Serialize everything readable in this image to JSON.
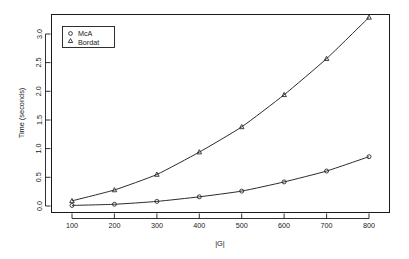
{
  "chart_data": {
    "type": "line",
    "title": "",
    "subtitle": "",
    "xlabel": "|G|",
    "ylabel": "Time (seconds)",
    "x": [
      100,
      200,
      300,
      400,
      500,
      600,
      700,
      800
    ],
    "xlim": [
      60,
      840
    ],
    "ylim": [
      -0.09,
      3.45
    ],
    "xticks": [
      100,
      200,
      300,
      400,
      500,
      600,
      700,
      800
    ],
    "xticklabels": [
      "100",
      "200",
      "300",
      "400",
      "500",
      "600",
      "700",
      "800"
    ],
    "yticks": [
      0.0,
      0.5,
      1.0,
      1.5,
      2.0,
      2.5,
      3.0
    ],
    "yticklabels": [
      "0.0",
      "0.5",
      "1.0",
      "1.5",
      "2.0",
      "2.5",
      "3.0"
    ],
    "grid": false,
    "legend_position": "upper left",
    "series": [
      {
        "name": "McA",
        "marker": "circle",
        "color": "#2b2b2b",
        "values": [
          0.01,
          0.03,
          0.08,
          0.16,
          0.26,
          0.42,
          0.61,
          0.86
        ]
      },
      {
        "name": "Bordat",
        "marker": "triangle",
        "color": "#2b2b2b",
        "values": [
          0.09,
          0.28,
          0.55,
          0.94,
          1.38,
          1.94,
          2.57,
          3.29
        ]
      }
    ]
  },
  "legend": {
    "entries": [
      {
        "label": "McA",
        "marker": "circle"
      },
      {
        "label": "Bordat",
        "marker": "triangle"
      }
    ]
  },
  "axes": {
    "x_title": "|G|",
    "y_title": "Time (seconds)"
  }
}
